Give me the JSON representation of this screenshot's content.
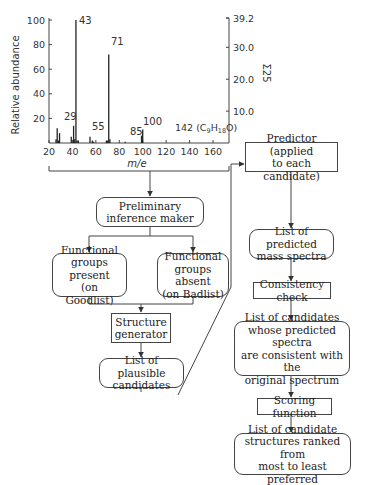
{
  "chart_data": {
    "type": "bar",
    "title": "",
    "xlabel": "m/e",
    "ylabel": "Relative abundance",
    "ylabel_right": "Σ25",
    "xlim": [
      20,
      170
    ],
    "ylim": [
      0,
      100
    ],
    "ylim_right": [
      0,
      39.2
    ],
    "x_ticks": [
      20,
      40,
      60,
      80,
      100,
      120,
      140,
      160
    ],
    "y_ticks": [
      20,
      40,
      60,
      80,
      100
    ],
    "y_ticks_right": [
      "10.0",
      "20.0",
      "30.0",
      "39.2"
    ],
    "grid": false,
    "peaks": [
      {
        "mz": 26,
        "value": 3
      },
      {
        "mz": 27,
        "value": 12
      },
      {
        "mz": 28,
        "value": 2
      },
      {
        "mz": 29,
        "value": 8
      },
      {
        "mz": 39,
        "value": 5
      },
      {
        "mz": 41,
        "value": 14
      },
      {
        "mz": 42,
        "value": 3
      },
      {
        "mz": 43,
        "value": 100
      },
      {
        "mz": 44,
        "value": 2
      },
      {
        "mz": 45,
        "value": 2
      },
      {
        "mz": 55,
        "value": 5
      },
      {
        "mz": 57,
        "value": 2
      },
      {
        "mz": 58,
        "value": 1
      },
      {
        "mz": 69,
        "value": 2
      },
      {
        "mz": 70,
        "value": 2
      },
      {
        "mz": 71,
        "value": 72
      },
      {
        "mz": 72,
        "value": 3
      },
      {
        "mz": 85,
        "value": 1
      },
      {
        "mz": 99,
        "value": 6
      },
      {
        "mz": 100,
        "value": 11
      }
    ],
    "peak_labels": [
      {
        "mz": 29,
        "label": "29"
      },
      {
        "mz": 43,
        "label": "43"
      },
      {
        "mz": 55,
        "label": "55"
      },
      {
        "mz": 71,
        "label": "71"
      },
      {
        "mz": 85,
        "label": "85"
      },
      {
        "mz": 100,
        "label": "100"
      },
      {
        "mz": 142,
        "label": "142 (C9H18O)"
      }
    ]
  },
  "chart_text": {
    "xlabel": "m/e",
    "ylabel": "Relative abundance",
    "ylabel_right": "Σ25",
    "annotation_142": "142 (C",
    "annotation_142_sub1": "9",
    "annotation_142_mid": "H",
    "annotation_142_sub2": "18",
    "annotation_142_end": "O)"
  },
  "flowchart": {
    "nodes": {
      "preliminary": "Preliminary\ninference maker",
      "goodlist": "Functional\ngroups present\n(on Goodlist)",
      "badlist": "Functional\ngroups absent\n(on Badlist)",
      "structure_generator": "Structure\ngenerator",
      "plausible": "List of plausible\ncandidates",
      "predictor": "Predictor (applied\nto each candidate)",
      "predicted_spectra": "List of predicted\nmass spectra",
      "consistency": "Consistency check",
      "consistent_candidates": "List of candidates\nwhose predicted spectra\nare consistent with the\noriginal spectrum",
      "scoring": "Scoring function",
      "ranked": "List of candidate\nstructures ranked from\nmost to least preferred"
    }
  }
}
